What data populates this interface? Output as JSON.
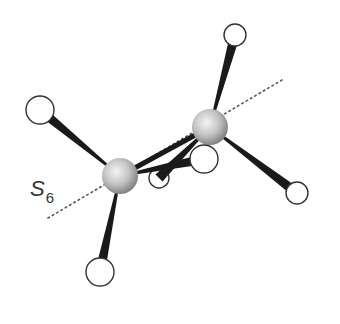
{
  "diagram": {
    "axis_label": {
      "symbol": "S",
      "subscript": "6"
    },
    "colors": {
      "carbon_light": "#f2f2f2",
      "carbon_dark": "#8a8a8a",
      "bond": "#1a1a1a",
      "hydrogen_fill": "#ffffff",
      "hydrogen_stroke": "#333333",
      "axis": "#555555"
    },
    "atoms": {
      "carbons": [
        {
          "id": "C1",
          "cx": 120,
          "cy": 176,
          "r": 18
        },
        {
          "id": "C2",
          "cx": 210,
          "cy": 127,
          "r": 18
        }
      ],
      "hydrogens": [
        {
          "id": "H1",
          "bonded_to": "C1",
          "cx": 40,
          "cy": 110,
          "r": 14
        },
        {
          "id": "H2",
          "bonded_to": "C1",
          "cx": 100,
          "cy": 272,
          "r": 14
        },
        {
          "id": "H3",
          "bonded_to": "C1",
          "cx": 204,
          "cy": 159,
          "r": 14
        },
        {
          "id": "H4",
          "bonded_to": "C2",
          "cx": 235,
          "cy": 35,
          "r": 11
        },
        {
          "id": "H5",
          "bonded_to": "C2",
          "cx": 297,
          "cy": 193,
          "r": 11
        },
        {
          "id": "H6",
          "bonded_to": "C2",
          "cx": 159,
          "cy": 178,
          "r": 10
        }
      ]
    },
    "axis_line": {
      "x1": 48,
      "y1": 218,
      "x2": 282,
      "y2": 80
    }
  }
}
